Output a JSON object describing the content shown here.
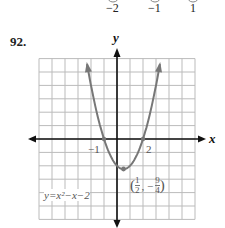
{
  "problem": {
    "number": "92."
  },
  "top_fragment": {
    "labels": [
      "−2",
      "−1",
      "1"
    ]
  },
  "chart_data": {
    "type": "line",
    "title": "",
    "equation": "y=x²−x−2",
    "xlabel": "x",
    "ylabel": "y",
    "xlim": [
      -6,
      6
    ],
    "ylim": [
      -6,
      6
    ],
    "grid": true,
    "series": [
      {
        "name": "y=x²−x−2",
        "color": "#777777",
        "x": [
          -2.4,
          -2,
          -1,
          0,
          0.5,
          1,
          2,
          3,
          3.4
        ],
        "y": [
          6.16,
          4,
          0,
          -2,
          -2.25,
          -2,
          0,
          4,
          6.16
        ]
      }
    ],
    "annotations": [
      {
        "text": "−1",
        "x": -1,
        "y": 0
      },
      {
        "text": "2",
        "x": 2,
        "y": 0
      },
      {
        "text": "(1/2, −9/4)",
        "x": 0.5,
        "y": -2.25
      }
    ]
  },
  "labels": {
    "x_axis": "x",
    "y_axis": "y",
    "root_left": "−1",
    "root_right": "2",
    "vertex_open": "(",
    "vertex_x_num": "1",
    "vertex_x_den": "2",
    "vertex_sep": ", −",
    "vertex_y_num": "9",
    "vertex_y_den": "4",
    "vertex_close": ")",
    "equation": "y=x²−x−2"
  }
}
